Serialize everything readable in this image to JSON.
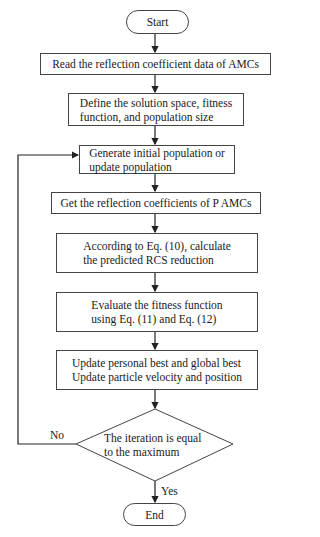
{
  "flowchart": {
    "start": "Start",
    "steps": [
      "Read the reflection coefficient data of AMCs",
      "Define the solution space, fitness\nfunction, and population size",
      "Generate initial population or\nupdate population",
      "Get the reflection coefficients of P AMCs",
      "According to Eq. (10), calculate\nthe predicted RCS reduction",
      "Evaluate the fitness function\nusing Eq. (11) and Eq. (12)",
      "Update personal best and global best\nUpdate particle velocity and position"
    ],
    "decision": "The iteration is equal\nto the maximum",
    "no_label": "No",
    "yes_label": "Yes",
    "end": "End"
  }
}
